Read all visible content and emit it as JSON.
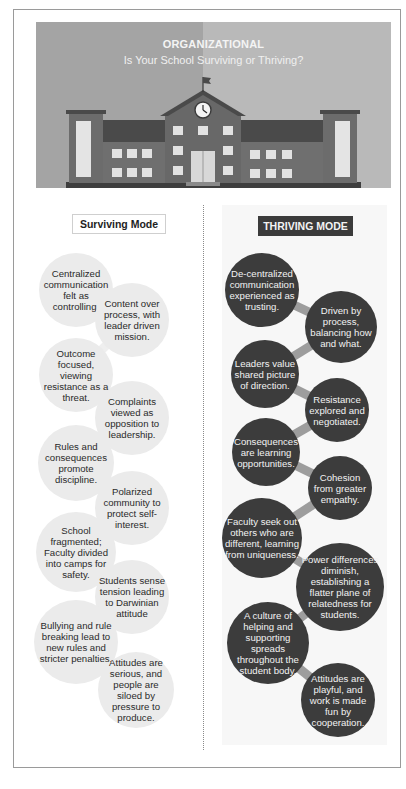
{
  "banner": {
    "title": "ORGANIZATIONAL",
    "subtitle": "Is Your School Surviving or Thriving?",
    "illustration": "school-building-with-clock-and-flag",
    "colors": {
      "left_bg": "#a4a4a4",
      "right_bg": "#b9b9b9",
      "brick": "#6a6a6a",
      "roof": "#4a4a4a",
      "window": "#e6e6e6"
    }
  },
  "surviving": {
    "header": "Surviving Mode",
    "bubble_color": "#ebebeb",
    "items": [
      "Centralized communication felt as controlling.",
      "Content over process, with leader driven mission.",
      "Outcome focused, viewing resistance as a threat.",
      "Complaints viewed as opposition to leadership.",
      "Rules and consequences promote discipline.",
      "Polarized community to protect self-interest.",
      "School fragmented; Faculty divided into camps for safety.",
      "Students sense tension leading to Darwinian attitude",
      "Bullying and rule breaking lead to new rules and stricter penalties.",
      "Attitudes are serious, and people are siloed by pressure to produce."
    ]
  },
  "thriving": {
    "header": "THRIVING MODE",
    "bubble_color": "#3c3c3c",
    "connector_color": "#9d9d9d",
    "items": [
      "De-centralized communication experienced as trusting.",
      "Driven by process, balancing how and what.",
      "Leaders value shared picture of direction.",
      "Resistance explored and negotiated.",
      "Consequences are learning opportunities.",
      "Cohesion from greater empathy.",
      "Faculty seek out others who are different, learning from uniqueness.",
      "Power differences diminish, establishing a flatter plane of relatedness for students.",
      "A culture of helping and supporting spreads throughout the student body.",
      "Attitudes are playful, and work is made fun by cooperation."
    ]
  }
}
